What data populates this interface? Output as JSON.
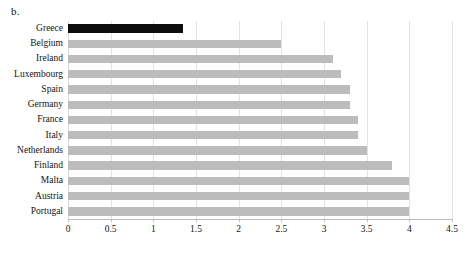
{
  "figure": {
    "panel_letter": "b."
  },
  "chart_data": {
    "type": "bar",
    "orientation": "horizontal",
    "title": "",
    "subtitle": "",
    "xlabel": "",
    "ylabel": "",
    "categories": [
      "Greece",
      "Belgium",
      "Ireland",
      "Luxembourg",
      "Spain",
      "Germany",
      "France",
      "Italy",
      "Netherlands",
      "Finland",
      "Malta",
      "Austria",
      "Portugal"
    ],
    "values": [
      1.35,
      2.5,
      3.1,
      3.2,
      3.3,
      3.3,
      3.4,
      3.4,
      3.5,
      3.8,
      4.0,
      4.0,
      4.0
    ],
    "highlight_index": 0,
    "xlim": [
      0,
      4.5
    ],
    "xticks": [
      0,
      0.5,
      1,
      1.5,
      2,
      2.5,
      3,
      3.5,
      4,
      4.5
    ],
    "xtick_labels": [
      "0",
      "0.5",
      "1",
      "1.5",
      "2",
      "2.5",
      "3",
      "3.5",
      "4",
      "4.5"
    ],
    "grid": true,
    "grid_axis": "x",
    "legend": false,
    "legend_position": "none",
    "colors": {
      "bar": "#bcbcbc",
      "bar_highlight": "#0d0d0d",
      "gridline": "#e2e2e2",
      "axis": "#bdbdbd",
      "text": "#141414",
      "background": "#ffffff"
    }
  }
}
